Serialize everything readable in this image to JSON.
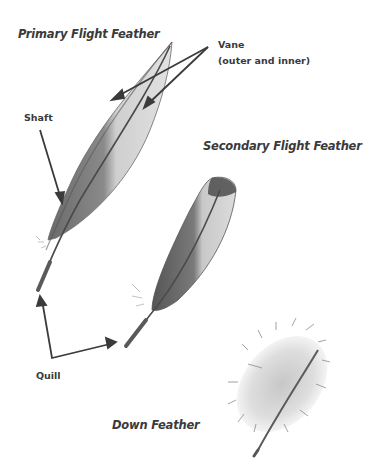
{
  "diagram": {
    "feathers": [
      {
        "id": "primary",
        "title": "Primary Flight Feather"
      },
      {
        "id": "secondary",
        "title": "Secondary Flight Feather"
      },
      {
        "id": "down",
        "title": "Down Feather"
      }
    ],
    "parts": {
      "vane": {
        "label": "Vane",
        "sublabel": "(outer and inner)"
      },
      "shaft": {
        "label": "Shaft"
      },
      "quill": {
        "label": "Quill"
      }
    },
    "colors": {
      "text": "#3a3a3a",
      "arrow": "#3b3b3b",
      "feather_dark": "#5a5a5a",
      "feather_light": "#d4d4d4",
      "background": "#ffffff"
    }
  }
}
